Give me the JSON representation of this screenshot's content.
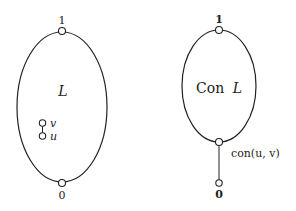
{
  "diagram": {
    "left": {
      "region_label": "L",
      "top_label": "1",
      "bottom_label": "0",
      "inner_nodes": [
        {
          "label": "v"
        },
        {
          "label": "u"
        }
      ]
    },
    "right": {
      "region_label_prefix": "Con",
      "region_label_var": "L",
      "top_label": "1",
      "bottom_node_label": "con(u, v)",
      "bottom_label": "0"
    }
  }
}
